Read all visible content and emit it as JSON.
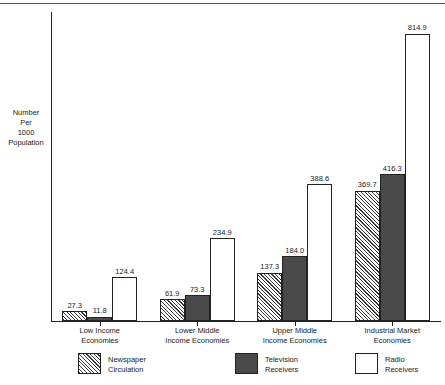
{
  "chart_data": {
    "type": "bar",
    "title": "",
    "subtitle": "",
    "xlabel": "",
    "ylabel": "Number Per 1000 Population",
    "ylabel_lines": [
      "Number",
      "Per",
      "1000",
      "Population"
    ],
    "ylim": [
      0,
      880
    ],
    "grid": false,
    "legend_position": "bottom",
    "categories": [
      "Low Income Economies",
      "Lower Middle Income Economies",
      "Upper Middle Income Economies",
      "Industrial Market Economies"
    ],
    "category_lines": [
      [
        "Low Income",
        "Economies"
      ],
      [
        "Lower Middle",
        "Income Economies"
      ],
      [
        "Upper Middle",
        "Income Economies"
      ],
      [
        "Industrial Market",
        "Economies"
      ]
    ],
    "series": [
      {
        "name": "Newspaper Circulation",
        "name_lines": [
          "Newspaper",
          "Circulation"
        ],
        "pattern": "diagonal-hatch",
        "color": "#ffffff",
        "values": [
          27.3,
          11.8,
          137.3,
          369.7
        ],
        "labels": [
          "27.3",
          "11.8",
          "137.3",
          "369.7"
        ]
      },
      {
        "name": "Television Receivers",
        "name_lines": [
          "Television",
          "Receivers"
        ],
        "pattern": "solid",
        "color": "#4a4a4a",
        "values": [
          11.8,
          73.3,
          184.0,
          416.3
        ],
        "labels": [
          "11.8",
          "73.3",
          "184.0",
          "416.3"
        ]
      },
      {
        "name": "Radio Receivers",
        "name_lines": [
          "Radio",
          "Receivers"
        ],
        "pattern": "empty",
        "color": "#ffffff",
        "values": [
          124.4,
          234.9,
          388.6,
          814.9
        ],
        "labels": [
          "124.4",
          "234.9",
          "388.6",
          "814.9"
        ]
      }
    ],
    "groups": [
      {
        "category_lines": [
          "Low Income",
          "Economies"
        ],
        "bars": [
          {
            "series": "Newspaper Circulation",
            "value": 27.3,
            "label": "27.3",
            "style": "newspaper"
          },
          {
            "series": "Television Receivers",
            "value": 11.8,
            "label": "11.8",
            "style": "television"
          },
          {
            "series": "Radio Receivers",
            "value": 124.4,
            "label": "124.4",
            "style": "radio"
          }
        ]
      },
      {
        "category_lines": [
          "Lower Middle",
          "Income Economies"
        ],
        "bars": [
          {
            "series": "Newspaper Circulation",
            "value": 61.9,
            "label": "61.9",
            "style": "newspaper"
          },
          {
            "series": "Television Receivers",
            "value": 73.3,
            "label": "73.3",
            "style": "television"
          },
          {
            "series": "Radio Receivers",
            "value": 234.9,
            "label": "234.9",
            "style": "radio"
          }
        ]
      },
      {
        "category_lines": [
          "Upper Middle",
          "Income Economies"
        ],
        "bars": [
          {
            "series": "Newspaper Circulation",
            "value": 137.3,
            "label": "137.3",
            "style": "newspaper"
          },
          {
            "series": "Television Receivers",
            "value": 184.0,
            "label": "184.0",
            "style": "television"
          },
          {
            "series": "Radio Receivers",
            "value": 388.6,
            "label": "388.6",
            "style": "radio"
          }
        ]
      },
      {
        "category_lines": [
          "Industrial Market",
          "Economies"
        ],
        "bars": [
          {
            "series": "Newspaper Circulation",
            "value": 369.7,
            "label": "369.7",
            "style": "newspaper"
          },
          {
            "series": "Television Receivers",
            "value": 416.3,
            "label": "416.3",
            "style": "television"
          },
          {
            "series": "Radio Receivers",
            "value": 814.9,
            "label": "814.9",
            "style": "radio"
          }
        ]
      }
    ]
  },
  "colors": {
    "axis": "#222222",
    "newspaper_hatch": "#3a3a3a",
    "television_fill": "#4a4a4a",
    "radio_fill": "#ffffff",
    "text": "#1a1a1a"
  }
}
